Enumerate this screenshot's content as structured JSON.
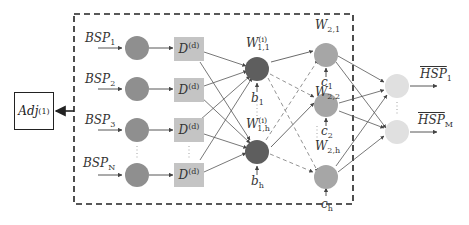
{
  "colors": {
    "input_node": "#8f8f8f",
    "delay_box": "#c4c4c4",
    "hidden1_node": "#5e5e5e",
    "hidden2_node": "#a6a6a6",
    "output_node": "#e0e0e0",
    "edge": "#444444",
    "dashed_box": "#222222"
  },
  "adj_box": {
    "label": "Adj",
    "sup": "(1)"
  },
  "inputs": [
    {
      "label": "BSP",
      "sub": "1"
    },
    {
      "label": "BSP",
      "sub": "2"
    },
    {
      "label": "BSP",
      "sub": "3"
    },
    {
      "label": "BSP",
      "sub": "N"
    }
  ],
  "delay_boxes": [
    {
      "label": "D",
      "sup": "(d)"
    },
    {
      "label": "D",
      "sup": "(d)"
    },
    {
      "label": "D",
      "sup": "(d)"
    },
    {
      "label": "D",
      "sup": "(d)"
    }
  ],
  "hidden1": [
    {
      "weight": "W",
      "sup": "(i)",
      "sub": "1,1",
      "bias": "b",
      "bias_sub": "1"
    },
    {
      "weight": "W",
      "sup": "(i)",
      "sub": "1,h",
      "bias": "b",
      "bias_sub": "h"
    }
  ],
  "hidden2": [
    {
      "weight": "W",
      "sub": "2,1",
      "bias": "c",
      "bias_sub": "1"
    },
    {
      "weight": "W",
      "sub": "2,2",
      "bias": "c",
      "bias_sub": "2"
    },
    {
      "weight": "W",
      "sub": "2,h",
      "bias": "c",
      "bias_sub": "h"
    }
  ],
  "outputs": [
    {
      "label": "HSP",
      "sub": "1"
    },
    {
      "label": "HSP",
      "sub": "M"
    }
  ],
  "ellipsis": "⋮"
}
